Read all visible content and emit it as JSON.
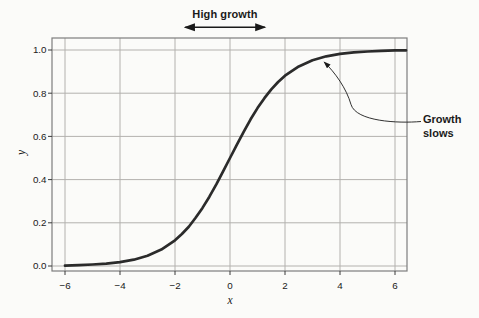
{
  "figure": {
    "background": "#fbfbf9"
  },
  "chart_data": {
    "type": "line",
    "title": "",
    "xlabel": "x",
    "ylabel": "y",
    "xlim": [
      -6.5,
      6.5
    ],
    "ylim": [
      -0.03,
      1.06
    ],
    "grid": true,
    "legend": "none",
    "axis_color": "#7d7d7d",
    "grid_color": "#b3b1ae",
    "tick_color": "#3a3a3a",
    "text_color": "#1a1a1a",
    "x_ticks": [
      -6,
      -4,
      -2,
      0,
      2,
      4,
      6
    ],
    "x_tick_labels": [
      "−6",
      "−4",
      "−2",
      "0",
      "2",
      "4",
      "6"
    ],
    "y_ticks": [
      0,
      0.2,
      0.4,
      0.6,
      0.8,
      1
    ],
    "y_tick_labels": [
      "0.0",
      "0.2",
      "0.4",
      "0.6",
      "0.8",
      "1.0"
    ],
    "series": [
      {
        "name": "logistic-growth-curve",
        "color": "#2b2b2b",
        "width": 2.7,
        "x": [
          -6,
          -5.5,
          -5,
          -4.5,
          -4,
          -3.5,
          -3,
          -2.5,
          -2,
          -1.75,
          -1.5,
          -1.25,
          -1,
          -0.75,
          -0.5,
          -0.25,
          0,
          0.25,
          0.5,
          0.75,
          1,
          1.25,
          1.5,
          1.75,
          2,
          2.5,
          3,
          3.5,
          4,
          4.5,
          5,
          5.5,
          6,
          6.4
        ],
        "y": [
          0.002,
          0.004,
          0.007,
          0.011,
          0.018,
          0.029,
          0.047,
          0.076,
          0.119,
          0.148,
          0.182,
          0.223,
          0.269,
          0.321,
          0.378,
          0.438,
          0.5,
          0.562,
          0.622,
          0.679,
          0.731,
          0.777,
          0.818,
          0.852,
          0.881,
          0.924,
          0.953,
          0.971,
          0.982,
          0.989,
          0.993,
          0.996,
          0.998,
          0.998
        ]
      }
    ],
    "annotations": [
      {
        "id": "high-growth",
        "kind": "double-arrow-span",
        "text": "High growth",
        "x_from": -1.67,
        "x_to": 1.31
      },
      {
        "id": "growth-slows",
        "kind": "leader-arrow",
        "text": "Growth slows",
        "target_x": 3.38,
        "target_y": 0.95
      }
    ]
  }
}
